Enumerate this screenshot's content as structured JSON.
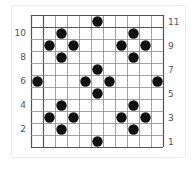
{
  "diagram": {
    "grid": {
      "rows": 11,
      "cols": 11,
      "cell_size_px": 12,
      "line_color": "#8a8a8a",
      "border_color": "#555555",
      "emphasis_line_color": "#555555",
      "emphasis_after_row": 1,
      "emphasis_after_col": 1
    },
    "dot_color": "#111111",
    "dots": [
      {
        "row": 1,
        "col": 6
      },
      {
        "row": 2,
        "col": 3
      },
      {
        "row": 2,
        "col": 9
      },
      {
        "row": 3,
        "col": 2
      },
      {
        "row": 3,
        "col": 4
      },
      {
        "row": 3,
        "col": 8
      },
      {
        "row": 3,
        "col": 10
      },
      {
        "row": 4,
        "col": 3
      },
      {
        "row": 4,
        "col": 9
      },
      {
        "row": 5,
        "col": 6
      },
      {
        "row": 6,
        "col": 1
      },
      {
        "row": 6,
        "col": 5
      },
      {
        "row": 6,
        "col": 7
      },
      {
        "row": 6,
        "col": 11
      },
      {
        "row": 7,
        "col": 6
      },
      {
        "row": 8,
        "col": 3
      },
      {
        "row": 8,
        "col": 9
      },
      {
        "row": 9,
        "col": 2
      },
      {
        "row": 9,
        "col": 4
      },
      {
        "row": 9,
        "col": 8
      },
      {
        "row": 9,
        "col": 10
      },
      {
        "row": 10,
        "col": 3
      },
      {
        "row": 10,
        "col": 9
      },
      {
        "row": 11,
        "col": 6
      }
    ],
    "left_labels": [
      {
        "text": "10",
        "row": 2
      },
      {
        "text": "8",
        "row": 4
      },
      {
        "text": "6",
        "row": 6
      },
      {
        "text": "4",
        "row": 8
      },
      {
        "text": "2",
        "row": 10
      }
    ],
    "right_labels": [
      {
        "text": "11",
        "row": 1
      },
      {
        "text": "9",
        "row": 3
      },
      {
        "text": "7",
        "row": 5
      },
      {
        "text": "5",
        "row": 7
      },
      {
        "text": "3",
        "row": 9
      },
      {
        "text": "1",
        "row": 11
      }
    ]
  }
}
